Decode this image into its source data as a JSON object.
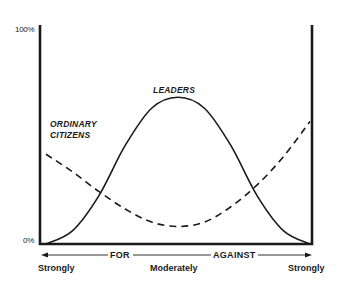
{
  "chart_data": {
    "type": "line",
    "title": "",
    "xlabel": "Strongly FOR ← Moderately → AGAINST Strongly",
    "ylabel": "",
    "y_ticks": [
      "100%",
      "0%"
    ],
    "ylim": [
      0,
      100
    ],
    "x_tick_labels": [
      "Strongly",
      "Moderately",
      "Strongly"
    ],
    "x_direction_labels": [
      "FOR",
      "AGAINST"
    ],
    "x": [
      0,
      10,
      20,
      30,
      40,
      50,
      60,
      70,
      80,
      90,
      100
    ],
    "series": [
      {
        "name": "LEADERS",
        "style": "solid",
        "values": [
          0,
          6,
          22,
          45,
          62,
          67,
          62,
          45,
          22,
          6,
          0
        ]
      },
      {
        "name": "ORDINARY CITIZENS",
        "style": "dashed",
        "values": [
          41,
          33,
          24,
          16,
          10,
          8,
          10,
          17,
          27,
          40,
          56
        ]
      }
    ],
    "annotations": [
      "LEADERS",
      "ORDINARY CITIZENS"
    ],
    "grid": false,
    "legend": "none (direct labels on curves)"
  },
  "labels": {
    "y_top": "100%",
    "y_bottom": "0%",
    "leaders": "LEADERS",
    "citizens_line1": "ORDINARY",
    "citizens_line2": "CITIZENS",
    "x_left": "Strongly",
    "x_mid": "Moderately",
    "x_right": "Strongly",
    "for": "FOR",
    "against": "AGAINST"
  },
  "colors": {
    "ink": "#1a1a1a",
    "background": "#ffffff"
  }
}
